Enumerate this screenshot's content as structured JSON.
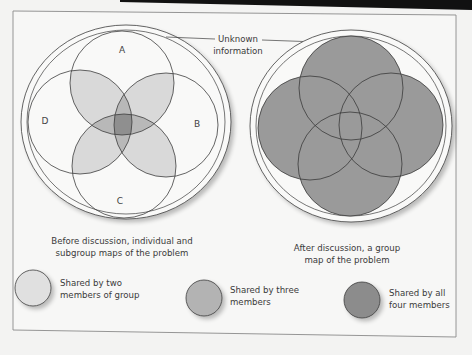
{
  "colors": {
    "background": "#f3f3f2",
    "paper": "#f7f7f6",
    "frame": "#8a8a8a",
    "stroke": "#3e3e3e",
    "two_members": "#d9d9d9",
    "three_members": "#b3b3b3",
    "four_members": "#8c8c8c",
    "after_fill": "#9a9a9a",
    "top_band": "#111111"
  },
  "annotation": {
    "line1": "Unknown",
    "line2": "information"
  },
  "left_diagram": {
    "labels": {
      "a": "A",
      "b": "B",
      "c": "C",
      "d": "D"
    },
    "caption_line1": "Before discussion, individual and",
    "caption_line2": "subgroup maps of the problem"
  },
  "right_diagram": {
    "caption_line1": "After discussion, a group",
    "caption_line2": "map of the problem"
  },
  "legend": [
    {
      "line1": "Shared by two",
      "line2": "members of group",
      "color_key": "two_members"
    },
    {
      "line1": "Shared by three",
      "line2": "members",
      "color_key": "three_members"
    },
    {
      "line1": "Shared by all",
      "line2": "four members",
      "color_key": "four_members"
    }
  ]
}
